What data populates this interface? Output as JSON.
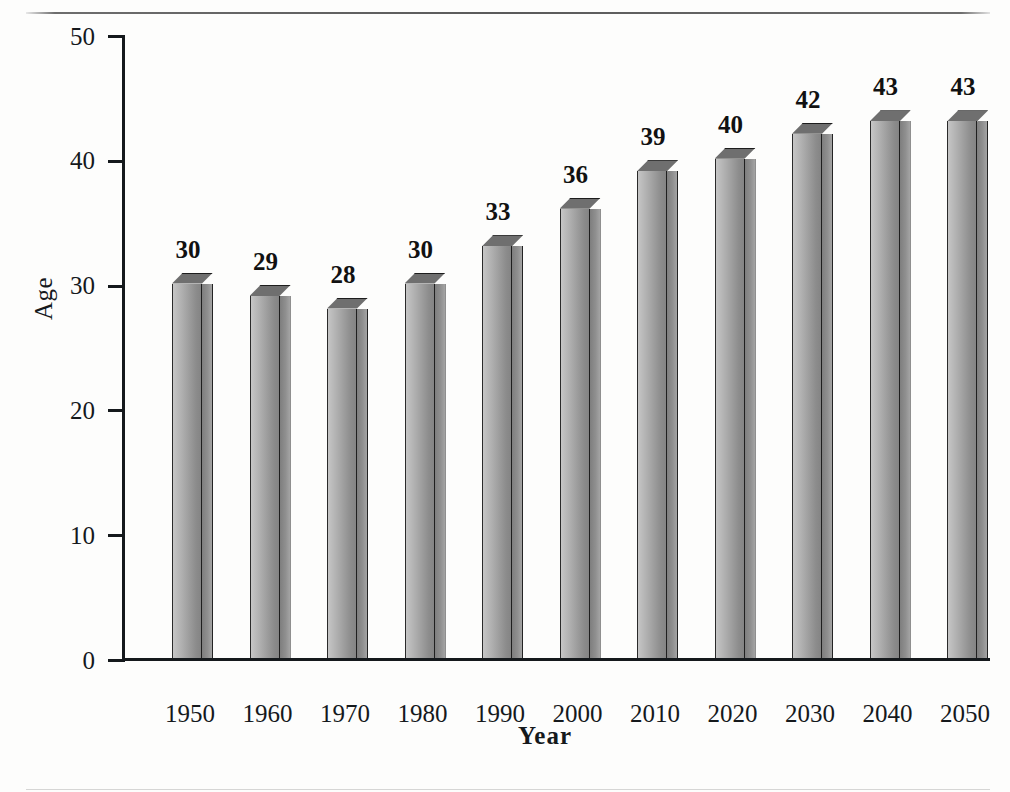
{
  "chart_data": {
    "type": "bar",
    "title": "",
    "xlabel": "Year",
    "ylabel": "Age",
    "categories": [
      "1950",
      "1960",
      "1970",
      "1980",
      "1990",
      "2000",
      "2010",
      "2020",
      "2030",
      "2040",
      "2050"
    ],
    "values": [
      30,
      29,
      28,
      30,
      33,
      36,
      39,
      40,
      42,
      43,
      43
    ],
    "data_labels": [
      "30",
      "29",
      "28",
      "30",
      "33",
      "36",
      "39",
      "40",
      "42",
      "43",
      "43"
    ],
    "ylim": [
      0,
      50
    ],
    "ytick_labels": [
      "0",
      "10",
      "20",
      "30",
      "40",
      "50"
    ],
    "ytick_values": [
      0,
      10,
      20,
      30,
      40,
      50
    ],
    "grid": false,
    "legend": null,
    "style": "3d-column",
    "colors": {
      "bar_light": "#c6c6c6",
      "bar_dark": "#848484",
      "bar_top": "#6f6f6f",
      "axis": "#15191c",
      "text": "#111111",
      "background": "#fdfdfc"
    }
  }
}
